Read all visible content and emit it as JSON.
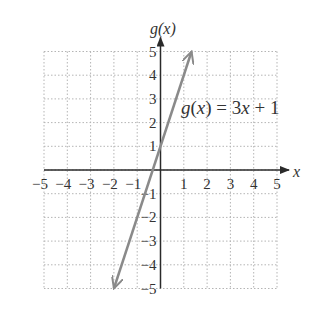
{
  "chart_data": {
    "type": "line",
    "title": "",
    "xlabel": "x",
    "ylabel": "g(x)",
    "xlim": [
      -5,
      5
    ],
    "ylim": [
      -5,
      5
    ],
    "grid": true,
    "x_ticks": [
      "-5",
      "-4",
      "-3",
      "-2",
      "-1",
      "1",
      "2",
      "3",
      "4",
      "5"
    ],
    "y_ticks": [
      "5",
      "4",
      "3",
      "2",
      "1",
      "-1",
      "-2",
      "-3",
      "-4",
      "-5"
    ],
    "series": [
      {
        "name": "g(x) = 3x + 1",
        "equation": "g(x) = 3x + 1",
        "slope": 3,
        "intercept": 1,
        "x": [
          -2,
          0,
          1.333
        ],
        "y": [
          -5,
          1,
          5
        ],
        "arrows_both_ends": true,
        "color": "#8a8a8a"
      }
    ],
    "annotations": [
      {
        "text": "g(x) = 3x + 1",
        "x": 1.4,
        "y": 3
      }
    ]
  },
  "labels": {
    "x_axis": "x",
    "y_axis": "g(x)",
    "equation_prefix": "g",
    "equation_paren_open": "(",
    "equation_var": "x",
    "equation_paren_close": ")",
    "equation_rest_a": " = 3",
    "equation_rest_x": "x",
    "equation_rest_b": " + 1"
  },
  "colors": {
    "axis": "#2a2a2a",
    "grid": "#b5b5b5",
    "line": "#8a8a8a",
    "text": "#333333"
  }
}
